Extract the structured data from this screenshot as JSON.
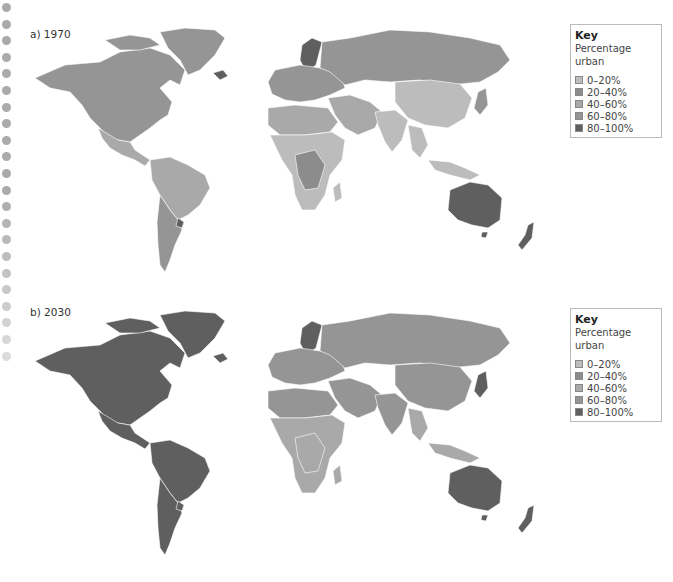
{
  "figure": {
    "panels": [
      {
        "label": "a) 1970",
        "legend": {
          "title": "Key",
          "subtitle": "Percentage urban",
          "entries": [
            {
              "label": "0–20%",
              "color": "#bcbcbc"
            },
            {
              "label": "20–40%",
              "color": "#8c8c8c"
            },
            {
              "label": "40–60%",
              "color": "#a9a9a9"
            },
            {
              "label": "60–80%",
              "color": "#959595"
            },
            {
              "label": "80–100%",
              "color": "#5f5f5f"
            }
          ]
        },
        "regions": {
          "north_america": "#959595",
          "greenland": "#959595",
          "iceland": "#5f5f5f",
          "mexico_central_america": "#a9a9a9",
          "south_america_north": "#a9a9a9",
          "south_america_south": "#959595",
          "uruguay": "#5f5f5f",
          "europe": "#959595",
          "scandinavia": "#5f5f5f",
          "russia": "#959595",
          "middle_east": "#a9a9a9",
          "north_africa": "#a9a9a9",
          "sub_saharan_africa": "#bcbcbc",
          "central_africa": "#8c8c8c",
          "south_asia": "#bcbcbc",
          "china": "#bcbcbc",
          "southeast_asia": "#bcbcbc",
          "japan": "#959595",
          "australia": "#5f5f5f",
          "new_zealand": "#5f5f5f"
        }
      },
      {
        "label": "b) 2030",
        "legend": {
          "title": "Key",
          "subtitle": "Percentage urban",
          "entries": [
            {
              "label": "0–20%",
              "color": "#bcbcbc"
            },
            {
              "label": "20–40%",
              "color": "#8c8c8c"
            },
            {
              "label": "40–60%",
              "color": "#a9a9a9"
            },
            {
              "label": "60–80%",
              "color": "#959595"
            },
            {
              "label": "80–100%",
              "color": "#5f5f5f"
            }
          ]
        },
        "regions": {
          "north_america": "#5f5f5f",
          "greenland": "#5f5f5f",
          "iceland": "#5f5f5f",
          "mexico_central_america": "#5f5f5f",
          "south_america_north": "#5f5f5f",
          "south_america_south": "#5f5f5f",
          "uruguay": "#5f5f5f",
          "europe": "#959595",
          "scandinavia": "#5f5f5f",
          "russia": "#959595",
          "middle_east": "#959595",
          "north_africa": "#959595",
          "sub_saharan_africa": "#a9a9a9",
          "central_africa": "#a9a9a9",
          "south_asia": "#959595",
          "china": "#959595",
          "southeast_asia": "#a9a9a9",
          "japan": "#5f5f5f",
          "australia": "#5f5f5f",
          "new_zealand": "#5f5f5f"
        }
      }
    ]
  },
  "chart_data": [
    {
      "type": "choropleth-map",
      "title": "a) 1970",
      "legend_title": "Key",
      "legend_subtitle": "Percentage urban",
      "classes": [
        "0–20%",
        "20–40%",
        "40–60%",
        "60–80%",
        "80–100%"
      ],
      "regions": {
        "North America": "60–80%",
        "Mexico / Central America": "40–60%",
        "South America (north)": "40–60%",
        "South America (south)": "60–80%",
        "Europe": "60–80%",
        "Scandinavia": "80–100%",
        "Russia": "60–80%",
        "Middle East": "40–60%",
        "North Africa": "40–60%",
        "Sub-Saharan Africa": "0–20%",
        "Central Africa": "20–40%",
        "South Asia": "0–20%",
        "China": "0–20%",
        "Southeast Asia": "0–20%",
        "Japan": "60–80%",
        "Australia": "80–100%",
        "New Zealand": "80–100%"
      }
    },
    {
      "type": "choropleth-map",
      "title": "b) 2030",
      "legend_title": "Key",
      "legend_subtitle": "Percentage urban",
      "classes": [
        "0–20%",
        "20–40%",
        "40–60%",
        "60–80%",
        "80–100%"
      ],
      "regions": {
        "North America": "80–100%",
        "Mexico / Central America": "80–100%",
        "South America (north)": "80–100%",
        "South America (south)": "80–100%",
        "Europe": "60–80%",
        "Scandinavia": "80–100%",
        "Russia": "60–80%",
        "Middle East": "60–80%",
        "North Africa": "60–80%",
        "Sub-Saharan Africa": "40–60%",
        "Central Africa": "40–60%",
        "South Asia": "60–80%",
        "China": "60–80%",
        "Southeast Asia": "40–60%",
        "Japan": "80–100%",
        "Australia": "80–100%",
        "New Zealand": "80–100%"
      }
    }
  ]
}
